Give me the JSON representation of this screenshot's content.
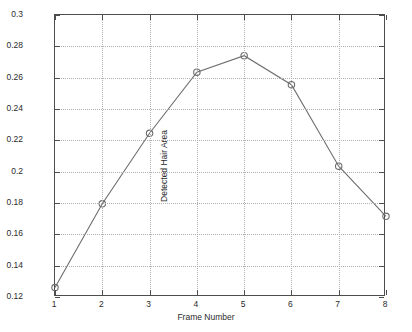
{
  "chart_data": {
    "type": "line",
    "title": "",
    "xlabel": "Frame Number",
    "ylabel": "Detected Hair Area",
    "x": [
      1,
      2,
      3,
      4,
      5,
      6,
      7,
      8
    ],
    "values": [
      0.126,
      0.1795,
      0.2245,
      0.2635,
      0.274,
      0.2555,
      0.2035,
      0.1715
    ],
    "xlim": [
      1,
      8
    ],
    "ylim": [
      0.12,
      0.3
    ],
    "xticks": [
      1,
      2,
      3,
      4,
      5,
      6,
      7,
      8
    ],
    "xticklabels": [
      "1",
      "2",
      "3",
      "4",
      "5",
      "6",
      "7",
      "8"
    ],
    "yticks": [
      0.12,
      0.14,
      0.16,
      0.18,
      0.2,
      0.22,
      0.24,
      0.26,
      0.28,
      0.3
    ],
    "yticklabels": [
      "0.12",
      "0.14",
      "0.16",
      "0.18",
      "0.2",
      "0.22",
      "0.24",
      "0.26",
      "0.28",
      "0.3"
    ],
    "grid": true,
    "grid_style": "dotted",
    "legend": null,
    "marker": "circle-open",
    "line_color": "#6e6e6e",
    "marker_color": "#6e6e6e",
    "axis_color": "#4d4d4d",
    "grid_color": "#b0b0b0",
    "background": "#ffffff"
  }
}
